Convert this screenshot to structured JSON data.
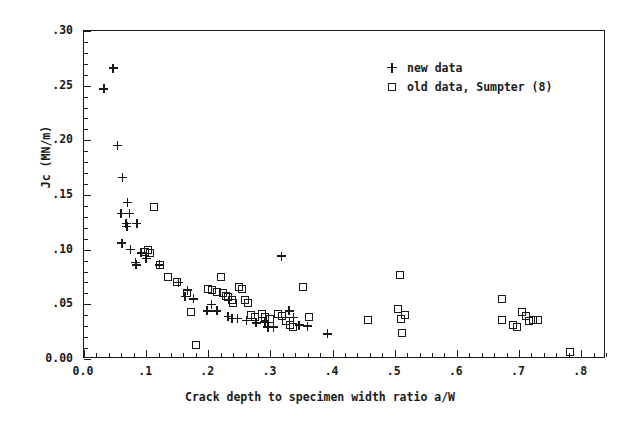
{
  "chart_data": {
    "type": "scatter",
    "title": "",
    "xlabel": "Crack depth to specimen width ratio a/W",
    "ylabel": "Jc (MN/m)",
    "xlim": [
      0.0,
      0.84
    ],
    "ylim": [
      0.0,
      0.3
    ],
    "grid": false,
    "legend_position": "top-right",
    "x_ticks": [
      "0.0",
      ".1",
      ".2",
      ".3",
      ".4",
      ".5",
      ".6",
      ".7",
      ".8"
    ],
    "x_tick_values": [
      0.0,
      0.1,
      0.2,
      0.3,
      0.4,
      0.5,
      0.6,
      0.7,
      0.8
    ],
    "x_minor_step": 0.02,
    "y_ticks": [
      "0.00",
      ".05",
      ".10",
      ".15",
      ".20",
      ".25",
      ".30"
    ],
    "y_tick_values": [
      0.0,
      0.05,
      0.1,
      0.15,
      0.2,
      0.25,
      0.3
    ],
    "y_minor_step": 0.01,
    "series": [
      {
        "name": "new data",
        "marker": "plus",
        "color": "#1a1a1a",
        "points": [
          [
            0.047,
            0.266
          ],
          [
            0.032,
            0.247
          ],
          [
            0.054,
            0.195
          ],
          [
            0.062,
            0.166
          ],
          [
            0.07,
            0.143
          ],
          [
            0.06,
            0.133
          ],
          [
            0.073,
            0.133
          ],
          [
            0.068,
            0.124
          ],
          [
            0.069,
            0.121
          ],
          [
            0.085,
            0.124
          ],
          [
            0.061,
            0.106
          ],
          [
            0.075,
            0.1
          ],
          [
            0.092,
            0.097
          ],
          [
            0.083,
            0.088
          ],
          [
            0.084,
            0.086
          ],
          [
            0.1,
            0.092
          ],
          [
            0.122,
            0.086
          ],
          [
            0.152,
            0.07
          ],
          [
            0.167,
            0.063
          ],
          [
            0.163,
            0.057
          ],
          [
            0.176,
            0.055
          ],
          [
            0.205,
            0.05
          ],
          [
            0.198,
            0.044
          ],
          [
            0.214,
            0.044
          ],
          [
            0.232,
            0.039
          ],
          [
            0.238,
            0.037
          ],
          [
            0.247,
            0.037
          ],
          [
            0.262,
            0.035
          ],
          [
            0.277,
            0.033
          ],
          [
            0.291,
            0.034
          ],
          [
            0.296,
            0.029
          ],
          [
            0.305,
            0.029
          ],
          [
            0.318,
            0.094
          ],
          [
            0.33,
            0.044
          ],
          [
            0.337,
            0.038
          ],
          [
            0.346,
            0.031
          ],
          [
            0.36,
            0.03
          ],
          [
            0.392,
            0.023
          ]
        ]
      },
      {
        "name": "old data, Sumpter (8)",
        "marker": "square",
        "color": "#1a1a1a",
        "points": [
          [
            0.112,
            0.139
          ],
          [
            0.103,
            0.1
          ],
          [
            0.098,
            0.098
          ],
          [
            0.107,
            0.097
          ],
          [
            0.123,
            0.086
          ],
          [
            0.135,
            0.075
          ],
          [
            0.15,
            0.07
          ],
          [
            0.166,
            0.06
          ],
          [
            0.172,
            0.043
          ],
          [
            0.18,
            0.013
          ],
          [
            0.2,
            0.064
          ],
          [
            0.206,
            0.063
          ],
          [
            0.214,
            0.061
          ],
          [
            0.221,
            0.075
          ],
          [
            0.223,
            0.06
          ],
          [
            0.228,
            0.058
          ],
          [
            0.232,
            0.057
          ],
          [
            0.238,
            0.054
          ],
          [
            0.24,
            0.051
          ],
          [
            0.249,
            0.066
          ],
          [
            0.254,
            0.064
          ],
          [
            0.259,
            0.054
          ],
          [
            0.264,
            0.051
          ],
          [
            0.268,
            0.04
          ],
          [
            0.275,
            0.038
          ],
          [
            0.286,
            0.041
          ],
          [
            0.292,
            0.038
          ],
          [
            0.3,
            0.037
          ],
          [
            0.312,
            0.041
          ],
          [
            0.318,
            0.039
          ],
          [
            0.325,
            0.035
          ],
          [
            0.332,
            0.031
          ],
          [
            0.337,
            0.029
          ],
          [
            0.352,
            0.066
          ],
          [
            0.362,
            0.038
          ],
          [
            0.457,
            0.036
          ],
          [
            0.508,
            0.077
          ],
          [
            0.505,
            0.046
          ],
          [
            0.516,
            0.04
          ],
          [
            0.51,
            0.037
          ],
          [
            0.512,
            0.024
          ],
          [
            0.672,
            0.055
          ],
          [
            0.673,
            0.036
          ],
          [
            0.69,
            0.031
          ],
          [
            0.697,
            0.029
          ],
          [
            0.705,
            0.043
          ],
          [
            0.712,
            0.039
          ],
          [
            0.716,
            0.035
          ],
          [
            0.722,
            0.036
          ],
          [
            0.73,
            0.036
          ],
          [
            0.782,
            0.006
          ]
        ]
      }
    ]
  }
}
